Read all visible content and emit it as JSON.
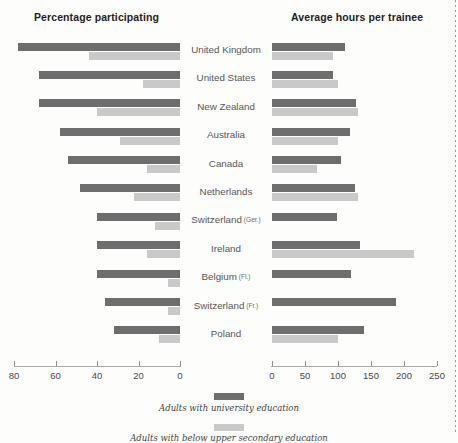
{
  "panels": {
    "left_title": "Percentage participating",
    "right_title": "Average hours per trainee"
  },
  "legend": [
    {
      "label": "Adults with university education",
      "color": "#6e6e6e"
    },
    {
      "label": "Adults with below upper secondary education",
      "color": "#c9c9c9"
    }
  ],
  "axis_left": {
    "ticks": [
      80,
      60,
      40,
      20,
      0
    ],
    "tick_labels": [
      "80",
      "60",
      "40",
      "20",
      "0"
    ],
    "max": 80,
    "reversed": true
  },
  "axis_right": {
    "ticks": [
      0,
      50,
      100,
      150,
      200,
      250
    ],
    "tick_labels": [
      "0",
      "50",
      "100",
      "150",
      "200",
      "250"
    ],
    "max": 250
  },
  "chart_data": {
    "type": "bar",
    "title": "",
    "orientation": "horizontal",
    "layout": "back-to-back paired panels sharing country axis",
    "grid": false,
    "legend_position": "bottom-center",
    "categories": [
      "United Kingdom",
      "United States",
      "New Zealand",
      "Australia",
      "Canada",
      "Netherlands",
      "Switzerland (Ger.)",
      "Ireland",
      "Belgium (Fl.)",
      "Switzerland (Fr.)",
      "Poland"
    ],
    "category_sub_labels": [
      "",
      "",
      "",
      "",
      "",
      "",
      "(Ger.)",
      "",
      "(Fl.)",
      "(Fr.)",
      ""
    ],
    "category_main_labels": [
      "United Kingdom",
      "United States",
      "New Zealand",
      "Australia",
      "Canada",
      "Netherlands",
      "Switzerland",
      "Ireland",
      "Belgium",
      "Switzerland",
      "Poland"
    ],
    "panels": [
      {
        "name": "Percentage participating",
        "xlabel": "",
        "ylabel": "",
        "xlim": [
          80,
          0
        ],
        "direction": "left",
        "series": [
          {
            "name": "Adults with university education",
            "color": "#6e6e6e",
            "values": [
              78,
              68,
              68,
              58,
              54,
              48,
              40,
              40,
              40,
              36,
              32
            ]
          },
          {
            "name": "Adults with below upper secondary education",
            "color": "#c9c9c9",
            "values": [
              44,
              18,
              40,
              29,
              16,
              22,
              12,
              16,
              6,
              6,
              10
            ]
          }
        ]
      },
      {
        "name": "Average hours per trainee",
        "xlabel": "",
        "ylabel": "",
        "xlim": [
          0,
          250
        ],
        "direction": "right",
        "series": [
          {
            "name": "Adults with university education",
            "color": "#6e6e6e",
            "values": [
              110,
              93,
              128,
              118,
              105,
              125,
              98,
              133,
              120,
              188,
              140
            ]
          },
          {
            "name": "Adults with below upper secondary education",
            "color": "#c9c9c9",
            "values": [
              93,
              100,
              130,
              100,
              68,
              130,
              0,
              215,
              0,
              0,
              100
            ]
          }
        ]
      }
    ]
  }
}
